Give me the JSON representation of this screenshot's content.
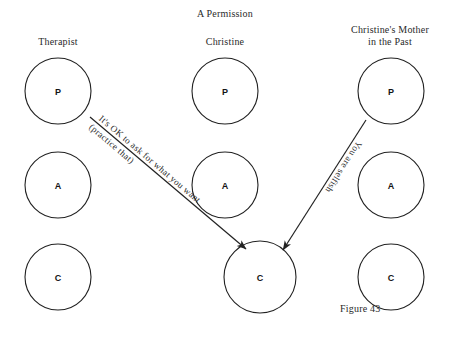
{
  "figure": {
    "title": "A Permission",
    "caption": "Figure 43",
    "background_color": "#ffffff",
    "ink_color": "#222222"
  },
  "columns": [
    {
      "id": "therapist",
      "label_lines": [
        "Therapist"
      ],
      "center_x": 58,
      "states": [
        {
          "letter": "P",
          "name": "parent",
          "cy": 91
        },
        {
          "letter": "A",
          "name": "adult",
          "cy": 185
        },
        {
          "letter": "C",
          "name": "child",
          "cy": 277
        }
      ]
    },
    {
      "id": "christine",
      "label_lines": [
        "Christine"
      ],
      "center_x": 225,
      "states": [
        {
          "letter": "P",
          "name": "parent",
          "cy": 91
        },
        {
          "letter": "A",
          "name": "adult",
          "cy": 185
        },
        {
          "letter": "C",
          "name": "child",
          "cy": 277
        }
      ]
    },
    {
      "id": "christines-mother-in-the-past",
      "label_lines": [
        "Christine's Mother",
        "in the Past"
      ],
      "center_x": 391,
      "states": [
        {
          "letter": "P",
          "name": "parent",
          "cy": 91
        },
        {
          "letter": "A",
          "name": "adult",
          "cy": 185
        },
        {
          "letter": "C",
          "name": "child",
          "cy": 277
        }
      ]
    }
  ],
  "transactions": [
    {
      "id": "therapist-permission",
      "from": "therapist-parent",
      "to": "christine-child",
      "lines": [
        "It's OK to ask for what you want",
        "(practice that)"
      ]
    },
    {
      "id": "mother-injunction",
      "from": "mothers-parent",
      "to": "christine-child",
      "lines": [
        "You are selfish"
      ]
    }
  ]
}
